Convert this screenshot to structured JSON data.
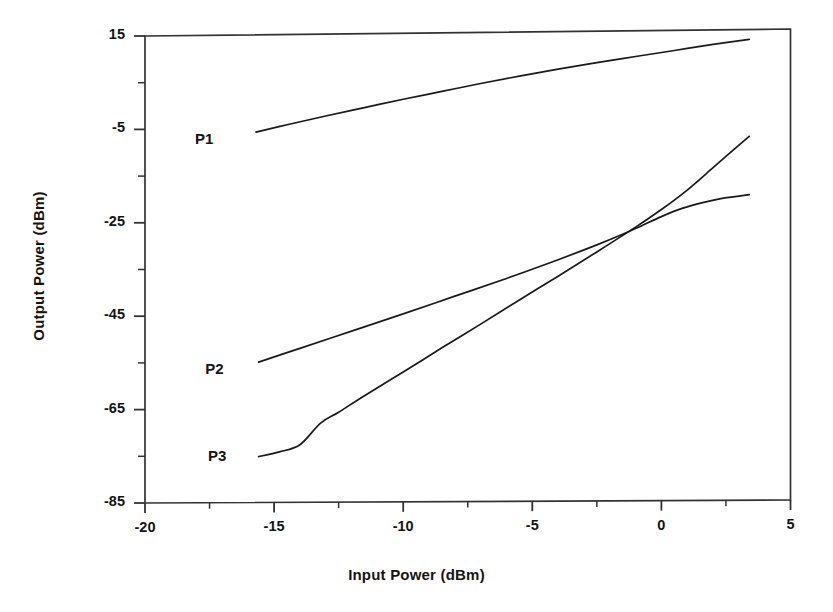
{
  "chart_data": {
    "type": "line",
    "title": "",
    "subtitle": "",
    "xlabel": "Input Power (dBm)",
    "ylabel": "Output Power (dBm)",
    "xlim": [
      -20,
      5
    ],
    "ylim": [
      -85,
      15
    ],
    "xticks": [
      -20,
      -15,
      -10,
      -5,
      0,
      5
    ],
    "xtick_labels": [
      "-20",
      "-15",
      "-10",
      "-5",
      "0",
      "5"
    ],
    "xminor_ticks": [
      -17.5,
      -12.5,
      -7.5,
      -2.5,
      2.5
    ],
    "yticks": [
      15,
      -5,
      -25,
      -45,
      -65,
      -85
    ],
    "ytick_labels": [
      "15",
      "-5",
      "-25",
      "-45",
      "-65",
      "-85"
    ],
    "yminor_ticks": [
      5,
      -15,
      -35,
      -55,
      -75
    ],
    "grid": false,
    "legend_position": "inline-annotations",
    "line_color": "#1a1a1a",
    "frame_color": "#333333",
    "background": "#ffffff",
    "annotations": [
      {
        "text": "P1",
        "x": -17.6,
        "y": -7.5
      },
      {
        "text": "P2",
        "x": -17.2,
        "y": -56.6
      },
      {
        "text": "P3",
        "x": -17.1,
        "y": -75.2
      }
    ],
    "series": [
      {
        "name": "P1",
        "label": "P1",
        "points": [
          [
            -15.7,
            -5.8
          ],
          [
            -14.5,
            -4.3
          ],
          [
            -13.0,
            -2.5
          ],
          [
            -11.5,
            -0.8
          ],
          [
            -10.0,
            0.9
          ],
          [
            -8.5,
            2.5
          ],
          [
            -7.0,
            4.1
          ],
          [
            -5.5,
            5.6
          ],
          [
            -4.0,
            7.0
          ],
          [
            -2.5,
            8.3
          ],
          [
            -1.0,
            9.5
          ],
          [
            0.5,
            10.7
          ],
          [
            2.0,
            11.9
          ],
          [
            3.4,
            12.9
          ]
        ]
      },
      {
        "name": "P2",
        "label": "P2",
        "points": [
          [
            -15.6,
            -55.0
          ],
          [
            -14.0,
            -52.1
          ],
          [
            -12.0,
            -48.5
          ],
          [
            -10.0,
            -44.9
          ],
          [
            -8.0,
            -41.2
          ],
          [
            -6.0,
            -37.5
          ],
          [
            -4.0,
            -33.6
          ],
          [
            -2.5,
            -30.5
          ],
          [
            -1.5,
            -28.3
          ],
          [
            -0.8,
            -26.6
          ],
          [
            0.0,
            -24.6
          ],
          [
            0.8,
            -22.9
          ],
          [
            1.6,
            -21.7
          ],
          [
            2.4,
            -20.8
          ],
          [
            3.4,
            -20.1
          ]
        ]
      },
      {
        "name": "P3",
        "label": "P3",
        "points": [
          [
            -15.6,
            -75.2
          ],
          [
            -14.8,
            -74.2
          ],
          [
            -14.0,
            -72.7
          ],
          [
            -13.2,
            -68.1
          ],
          [
            -12.5,
            -65.8
          ],
          [
            -11.5,
            -62.3
          ],
          [
            -10.0,
            -57.3
          ],
          [
            -8.5,
            -52.2
          ],
          [
            -7.0,
            -47.2
          ],
          [
            -5.5,
            -42.1
          ],
          [
            -4.0,
            -37.1
          ],
          [
            -2.5,
            -32.0
          ],
          [
            -1.0,
            -26.8
          ],
          [
            0.0,
            -23.1
          ],
          [
            1.0,
            -19.0
          ],
          [
            2.0,
            -14.3
          ],
          [
            2.8,
            -10.5
          ],
          [
            3.4,
            -7.7
          ]
        ]
      }
    ]
  }
}
